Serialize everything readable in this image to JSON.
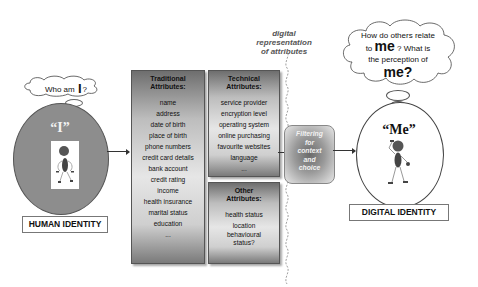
{
  "caption": {
    "line1": "digital representation",
    "line2": "of attributes"
  },
  "human": {
    "thought_prefix": "Who am",
    "thought_big": "I",
    "thought_suffix": "?",
    "symbol": "“I”",
    "label": "HUMAN IDENTITY"
  },
  "digital": {
    "thought_line1": "How do others relate",
    "thought_line2_prefix": "to",
    "thought_line2_big": "me",
    "thought_line2_suffix": "? What is",
    "thought_line3": "the perception of",
    "thought_line4": "me?",
    "symbol": "“Me”",
    "label": "DIGITAL IDENTITY"
  },
  "traditional": {
    "title_line1": "Traditional",
    "title_line2": "Attributes:",
    "items": [
      "name",
      "address",
      "date of birth",
      "place of birth",
      "phone numbers",
      "credit card details",
      "bank account",
      "credit rating",
      "income",
      "health insurance",
      "marital status",
      "education",
      "..."
    ]
  },
  "technical": {
    "title_line1": "Technical",
    "title_line2": "Attributes:",
    "items": [
      "service provider",
      "encryption level",
      "operating system",
      "online purchasing",
      "favourite websites",
      "language",
      "..."
    ]
  },
  "other": {
    "title_line1": "Other",
    "title_line2": "Attributes:",
    "items": [
      "health status",
      "location",
      "behavioural status?"
    ]
  },
  "filter": {
    "lines": [
      "Filtering",
      "for",
      "context",
      "and",
      "choice"
    ]
  }
}
